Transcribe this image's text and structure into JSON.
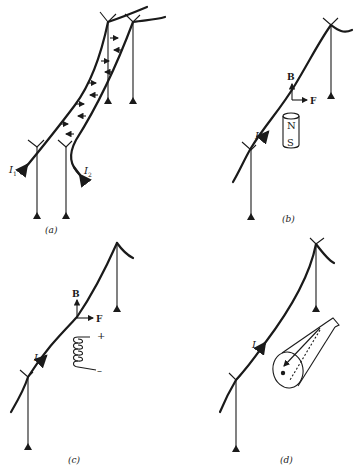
{
  "figure": {
    "panels": [
      {
        "id": "a",
        "caption": "(a)",
        "labels": {
          "current_1": "I",
          "current_1_sub": "1",
          "current_2": "I",
          "current_2_sub": "2"
        },
        "force_arrow_count": 10
      },
      {
        "id": "b",
        "caption": "(b)",
        "labels": {
          "current": "I",
          "field": "B",
          "force": "F",
          "magnet_north": "N",
          "magnet_south": "S"
        }
      },
      {
        "id": "c",
        "caption": "(c)",
        "labels": {
          "current": "I",
          "field": "B",
          "force": "F",
          "coil_plus": "+",
          "coil_minus": "–"
        }
      },
      {
        "id": "d",
        "caption": "(d)",
        "labels": {
          "current": "I"
        }
      }
    ],
    "colors": {
      "ink": "#1a1a1a",
      "background": "#ffffff"
    }
  }
}
